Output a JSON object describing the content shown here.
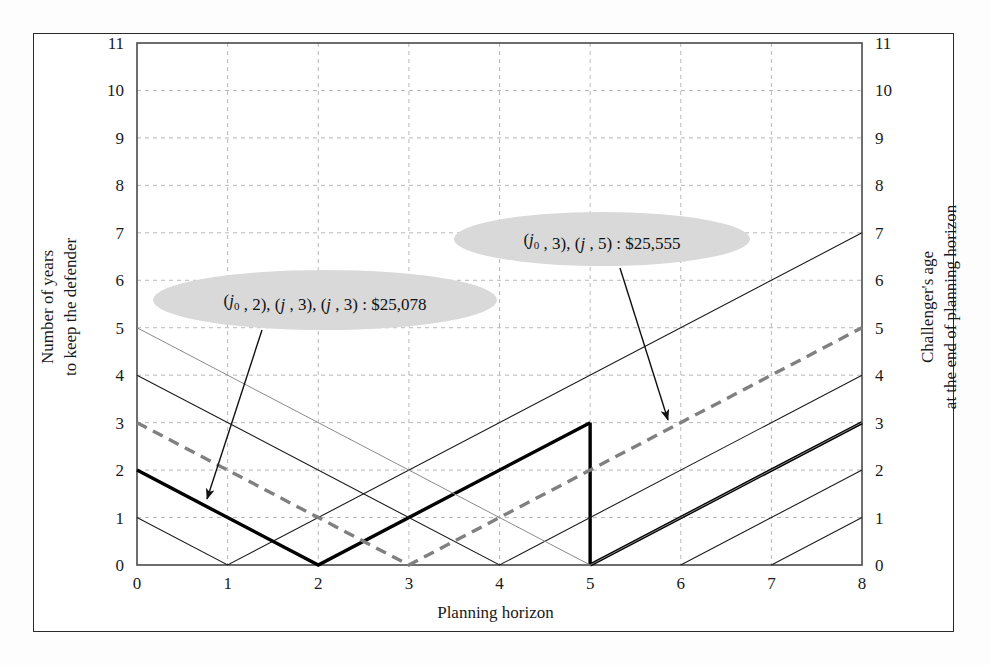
{
  "figure": {
    "axis_title_x": "Planning horizon",
    "axis_title_y_left_line1": "Number of years",
    "axis_title_y_left_line2": "to keep the defender",
    "axis_title_y_right_line1": "Challenger's age",
    "axis_title_y_right_line2": "at the end of planning horizon"
  },
  "annotations": [
    {
      "id": "callout-25078",
      "text": "(j0 , 2), (j , 3), (j , 3) : $25,078",
      "parts": [
        {
          "t": "(",
          "style": "roman"
        },
        {
          "t": "j",
          "style": "italic"
        },
        {
          "t": "0",
          "style": "sub"
        },
        {
          "t": " , 2), (",
          "style": "roman"
        },
        {
          "t": "j",
          "style": "italic"
        },
        {
          "t": " , 3), (",
          "style": "roman"
        },
        {
          "t": "j",
          "style": "italic"
        },
        {
          "t": " , 3) : $25,078",
          "style": "roman"
        }
      ],
      "amount": "$25,078",
      "cx": 325,
      "cy": 300,
      "rx": 172,
      "ry": 30,
      "arrow_from_x": 262,
      "arrow_from_y": 330,
      "arrow_to_x": 207,
      "arrow_to_y": 499
    },
    {
      "id": "callout-25555",
      "text": "(j0 , 3), (j , 5) : $25,555",
      "parts": [
        {
          "t": "(",
          "style": "roman"
        },
        {
          "t": "j",
          "style": "italic"
        },
        {
          "t": "0",
          "style": "sub"
        },
        {
          "t": " , 3), (",
          "style": "roman"
        },
        {
          "t": "j",
          "style": "italic"
        },
        {
          "t": " , 5) : $25,555",
          "style": "roman"
        }
      ],
      "amount": "$25,555",
      "cx": 602,
      "cy": 239,
      "rx": 148,
      "ry": 27,
      "arrow_from_x": 620,
      "arrow_from_y": 268,
      "arrow_to_x": 668,
      "arrow_to_y": 420
    }
  ],
  "colors": {
    "frame": "#2a2a2a",
    "axis": "#4a4a4a",
    "grid": "#b8b8b8",
    "thin_line": "#1c1c1c",
    "faint_line": "#8a8a8a",
    "thick_line": "#000000",
    "dashed_line": "#808080",
    "ellipse_fill": "#d9d9d9",
    "text": "#1a1a1a"
  },
  "chart_data": {
    "type": "line",
    "title": "",
    "xlabel": "Planning horizon",
    "ylabel": "Number of years to keep the defender",
    "ylabel_secondary": "Challenger's age at the end of planning horizon",
    "xlim": [
      0,
      8
    ],
    "ylim": [
      0,
      11
    ],
    "xticks": [
      0,
      1,
      2,
      3,
      4,
      5,
      6,
      7,
      8
    ],
    "yticks": [
      0,
      1,
      2,
      3,
      4,
      5,
      6,
      7,
      8,
      9,
      10,
      11
    ],
    "yticks_secondary": [
      0,
      1,
      2,
      3,
      4,
      5,
      6,
      7,
      8,
      9,
      10,
      11
    ],
    "grid": true,
    "legend": "none",
    "series": [
      {
        "name": "v-vertex-1",
        "style": "thin",
        "points": [
          [
            0,
            1
          ],
          [
            1,
            0
          ],
          [
            8,
            7
          ]
        ]
      },
      {
        "name": "v-vertex-2-optimal",
        "style": "thick",
        "points": [
          [
            0,
            2
          ],
          [
            2,
            0
          ],
          [
            5,
            3
          ]
        ]
      },
      {
        "name": "v-vertex-2-tail",
        "style": "thick",
        "points": [
          [
            5,
            0
          ],
          [
            8,
            3
          ]
        ]
      },
      {
        "name": "vertical-drop-at-5",
        "style": "thick",
        "points": [
          [
            5,
            3
          ],
          [
            5,
            0
          ]
        ]
      },
      {
        "name": "v-vertex-3-dashed",
        "style": "dashed",
        "points": [
          [
            0,
            3
          ],
          [
            3,
            0
          ],
          [
            8,
            5
          ]
        ]
      },
      {
        "name": "v-vertex-4",
        "style": "thin",
        "points": [
          [
            0,
            4
          ],
          [
            4,
            0
          ],
          [
            8,
            4
          ]
        ]
      },
      {
        "name": "v-vertex-5-faint",
        "style": "faint",
        "points": [
          [
            0,
            5
          ],
          [
            5,
            0
          ],
          [
            8,
            3
          ]
        ]
      },
      {
        "name": "ray-from-6",
        "style": "thin",
        "points": [
          [
            6,
            0
          ],
          [
            8,
            2
          ]
        ]
      },
      {
        "name": "ray-from-7",
        "style": "thin",
        "points": [
          [
            7,
            0
          ],
          [
            8,
            1
          ]
        ]
      }
    ]
  }
}
